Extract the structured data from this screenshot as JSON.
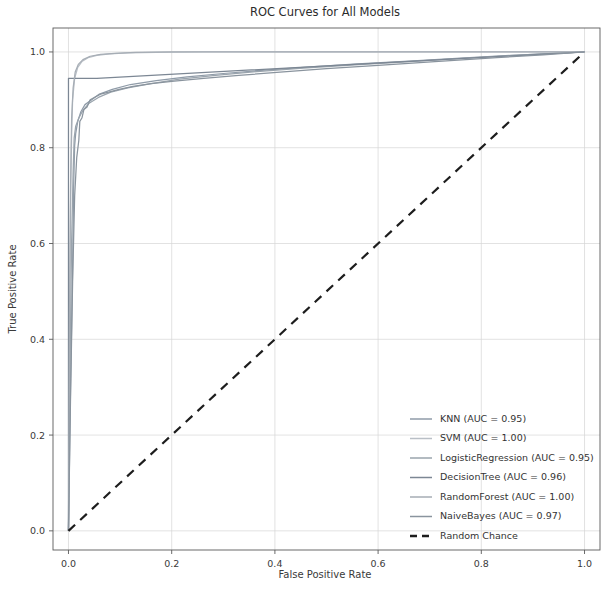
{
  "chart_data": {
    "type": "line",
    "title": "ROC Curves for All Models",
    "xlabel": "False Positive Rate",
    "ylabel": "True Positive Rate",
    "xlim": [
      -0.03,
      1.03
    ],
    "ylim": [
      -0.04,
      1.05
    ],
    "grid": true,
    "legend_position": "lower right",
    "xticks": [
      "0.0",
      "0.2",
      "0.4",
      "0.6",
      "0.8",
      "1.0"
    ],
    "xtick_values": [
      0.0,
      0.2,
      0.4,
      0.6,
      0.8,
      1.0
    ],
    "yticks": [
      "0.0",
      "0.2",
      "0.4",
      "0.6",
      "0.8",
      "1.0"
    ],
    "ytick_values": [
      0.0,
      0.2,
      0.4,
      0.6,
      0.8,
      1.0
    ],
    "series": [
      {
        "name": "KNN",
        "auc": "0.95",
        "legend_label": "KNN (AUC = 0.95)",
        "color": "#8f9ba8",
        "dashed": false,
        "points": [
          [
            0.0,
            0.0
          ],
          [
            0.004,
            0.3
          ],
          [
            0.008,
            0.55
          ],
          [
            0.01,
            0.72
          ],
          [
            0.012,
            0.805
          ],
          [
            0.014,
            0.83
          ],
          [
            0.018,
            0.855
          ],
          [
            0.024,
            0.875
          ],
          [
            0.032,
            0.89
          ],
          [
            0.045,
            0.9
          ],
          [
            0.06,
            0.912
          ],
          [
            0.085,
            0.922
          ],
          [
            0.12,
            0.932
          ],
          [
            0.17,
            0.94
          ],
          [
            0.23,
            0.948
          ],
          [
            0.3,
            0.955
          ],
          [
            0.38,
            0.962
          ],
          [
            0.47,
            0.969
          ],
          [
            0.56,
            0.975
          ],
          [
            0.66,
            0.981
          ],
          [
            0.76,
            0.987
          ],
          [
            0.86,
            0.993
          ],
          [
            0.94,
            0.997
          ],
          [
            1.0,
            1.0
          ]
        ]
      },
      {
        "name": "SVM",
        "auc": "1.00",
        "legend_label": "SVM (AUC = 1.00)",
        "color": "#b9bfc6",
        "dashed": false,
        "points": [
          [
            0.0,
            0.0
          ],
          [
            0.002,
            0.4
          ],
          [
            0.004,
            0.68
          ],
          [
            0.006,
            0.82
          ],
          [
            0.008,
            0.9
          ],
          [
            0.012,
            0.945
          ],
          [
            0.018,
            0.968
          ],
          [
            0.026,
            0.98
          ],
          [
            0.038,
            0.988
          ],
          [
            0.055,
            0.993
          ],
          [
            0.08,
            0.996
          ],
          [
            0.115,
            0.998
          ],
          [
            0.17,
            0.999
          ],
          [
            0.26,
            1.0
          ],
          [
            0.5,
            1.0
          ],
          [
            1.0,
            1.0
          ]
        ]
      },
      {
        "name": "LogisticRegression",
        "auc": "0.95",
        "legend_label": "LogisticRegression (AUC = 0.95)",
        "color": "#9aa4ad",
        "dashed": false,
        "points": [
          [
            0.0,
            0.0
          ],
          [
            0.003,
            0.34
          ],
          [
            0.006,
            0.6
          ],
          [
            0.009,
            0.75
          ],
          [
            0.011,
            0.82
          ],
          [
            0.014,
            0.845
          ],
          [
            0.02,
            0.862
          ],
          [
            0.028,
            0.878
          ],
          [
            0.04,
            0.893
          ],
          [
            0.058,
            0.905
          ],
          [
            0.082,
            0.916
          ],
          [
            0.115,
            0.925
          ],
          [
            0.16,
            0.934
          ],
          [
            0.215,
            0.943
          ],
          [
            0.285,
            0.951
          ],
          [
            0.365,
            0.959
          ],
          [
            0.455,
            0.966
          ],
          [
            0.555,
            0.973
          ],
          [
            0.66,
            0.98
          ],
          [
            0.77,
            0.987
          ],
          [
            0.88,
            0.994
          ],
          [
            1.0,
            1.0
          ]
        ]
      },
      {
        "name": "DecisionTree",
        "auc": "0.96",
        "legend_label": "DecisionTree (AUC = 0.96)",
        "color": "#7c8794",
        "dashed": false,
        "points": [
          [
            0.0,
            0.0
          ],
          [
            0.0,
            0.945
          ],
          [
            0.055,
            0.945
          ],
          [
            1.0,
            1.0
          ]
        ]
      },
      {
        "name": "RandomForest",
        "auc": "1.00",
        "legend_label": "RandomForest (AUC = 1.00)",
        "color": "#a6adb5",
        "dashed": false,
        "points": [
          [
            0.0,
            0.0
          ],
          [
            0.002,
            0.45
          ],
          [
            0.004,
            0.72
          ],
          [
            0.006,
            0.86
          ],
          [
            0.009,
            0.925
          ],
          [
            0.013,
            0.958
          ],
          [
            0.019,
            0.974
          ],
          [
            0.028,
            0.984
          ],
          [
            0.042,
            0.991
          ],
          [
            0.062,
            0.995
          ],
          [
            0.09,
            0.997
          ],
          [
            0.13,
            0.999
          ],
          [
            0.2,
            1.0
          ],
          [
            0.45,
            1.0
          ],
          [
            1.0,
            1.0
          ]
        ]
      },
      {
        "name": "NaiveBayes",
        "auc": "0.97",
        "legend_label": "NaiveBayes (AUC = 0.97)",
        "color": "#8a949e",
        "dashed": false,
        "points": [
          [
            0.0,
            0.0
          ],
          [
            0.004,
            0.28
          ],
          [
            0.008,
            0.52
          ],
          [
            0.012,
            0.7
          ],
          [
            0.016,
            0.78
          ],
          [
            0.02,
            0.815
          ],
          [
            0.022,
            0.855
          ],
          [
            0.026,
            0.862
          ],
          [
            0.03,
            0.88
          ],
          [
            0.036,
            0.885
          ],
          [
            0.042,
            0.9
          ],
          [
            0.05,
            0.905
          ],
          [
            0.062,
            0.912
          ],
          [
            0.078,
            0.916
          ],
          [
            0.098,
            0.922
          ],
          [
            0.125,
            0.928
          ],
          [
            0.16,
            0.934
          ],
          [
            0.205,
            0.939
          ],
          [
            0.262,
            0.945
          ],
          [
            0.33,
            0.951
          ],
          [
            0.41,
            0.958
          ],
          [
            0.5,
            0.965
          ],
          [
            0.6,
            0.972
          ],
          [
            0.71,
            0.98
          ],
          [
            0.83,
            0.988
          ],
          [
            0.92,
            0.994
          ],
          [
            1.0,
            1.0
          ]
        ]
      },
      {
        "name": "Random Chance",
        "legend_label": "Random Chance",
        "color": "#1d1d1d",
        "dashed": true,
        "points": [
          [
            0.0,
            0.0
          ],
          [
            1.0,
            1.0
          ]
        ]
      }
    ]
  },
  "figure": {
    "background": "#ffffff",
    "grid_color": "#d6d6d6",
    "axis_color": "#5a5a5a"
  }
}
